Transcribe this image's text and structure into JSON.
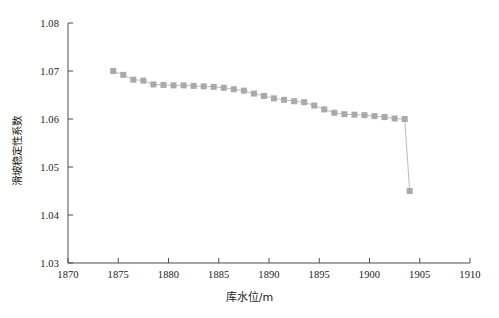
{
  "chart_data": {
    "type": "line",
    "title": "",
    "xlabel": "库水位/m",
    "ylabel": "滑坡稳定性系数",
    "xlim": [
      1870,
      1910
    ],
    "ylim": [
      1.03,
      1.08
    ],
    "xticks": [
      1870,
      1875,
      1880,
      1885,
      1890,
      1895,
      1900,
      1905,
      1910
    ],
    "yticks": [
      1.03,
      1.04,
      1.05,
      1.06,
      1.07,
      1.08
    ],
    "xtick_labels": [
      "1870",
      "1875",
      "1880",
      "1885",
      "1890",
      "1895",
      "1900",
      "1905",
      "1910"
    ],
    "ytick_labels": [
      "1.03",
      "1.04",
      "1.05",
      "1.06",
      "1.07",
      "1.08"
    ],
    "grid": false,
    "legend": null,
    "series": [
      {
        "name": "滑坡稳定性系数",
        "marker": "square",
        "marker_color": "#a9a9a9",
        "line_color": "#a9a9a9",
        "x": [
          1874.5,
          1875.5,
          1876.5,
          1877.5,
          1878.5,
          1879.5,
          1880.5,
          1881.5,
          1882.5,
          1883.5,
          1884.5,
          1885.5,
          1886.5,
          1887.5,
          1888.5,
          1889.5,
          1890.5,
          1891.5,
          1892.5,
          1893.5,
          1894.5,
          1895.5,
          1896.5,
          1897.5,
          1898.5,
          1899.5,
          1900.5,
          1901.5,
          1902.5,
          1903.5,
          1904.0
        ],
        "y": [
          1.07,
          1.0692,
          1.0682,
          1.068,
          1.0672,
          1.0671,
          1.067,
          1.067,
          1.0669,
          1.0668,
          1.0667,
          1.0665,
          1.0662,
          1.0659,
          1.0653,
          1.0648,
          1.0643,
          1.064,
          1.0637,
          1.0635,
          1.0628,
          1.062,
          1.0613,
          1.061,
          1.0609,
          1.0608,
          1.0606,
          1.0604,
          1.0601,
          1.06,
          1.045
        ]
      }
    ]
  }
}
